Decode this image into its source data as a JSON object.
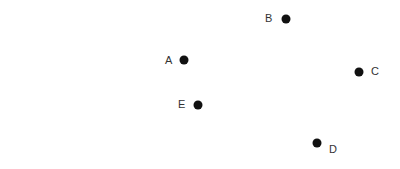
{
  "diagram": {
    "type": "labeled-points",
    "dot_color": "#111111",
    "label_color": "#333333",
    "dot_radius": 4.5,
    "points": [
      {
        "id": "A",
        "label": "A",
        "x": 184,
        "y": 60,
        "label_x": 165,
        "label_y": 61
      },
      {
        "id": "B",
        "label": "B",
        "x": 286,
        "y": 19,
        "label_x": 265,
        "label_y": 19
      },
      {
        "id": "C",
        "label": "C",
        "x": 359,
        "y": 72,
        "label_x": 371,
        "label_y": 72
      },
      {
        "id": "D",
        "label": "D",
        "x": 317,
        "y": 143,
        "label_x": 329,
        "label_y": 150
      },
      {
        "id": "E",
        "label": "E",
        "x": 198,
        "y": 105,
        "label_x": 178,
        "label_y": 105
      }
    ]
  }
}
